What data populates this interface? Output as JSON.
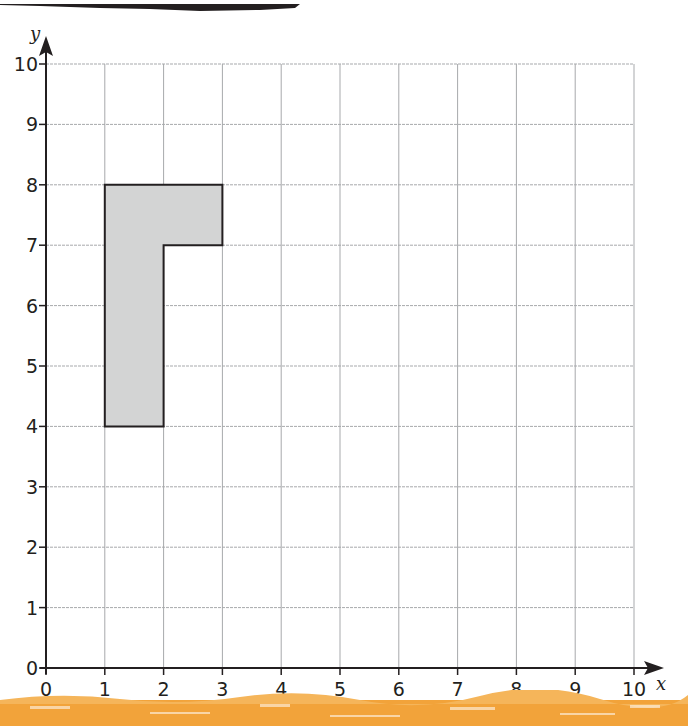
{
  "diagram": {
    "type": "coordinate-grid",
    "x_axis": {
      "label": "x",
      "min": 0,
      "max": 10,
      "ticks": [
        "0",
        "1",
        "2",
        "3",
        "4",
        "5",
        "6",
        "7",
        "8",
        "9",
        "10"
      ]
    },
    "y_axis": {
      "label": "y",
      "min": 0,
      "max": 10,
      "ticks": [
        "0",
        "1",
        "2",
        "3",
        "4",
        "5",
        "6",
        "7",
        "8",
        "9",
        "10"
      ]
    },
    "shape": {
      "name": "L-shape",
      "fill": "#d3d4d4",
      "stroke": "#231f20",
      "vertices": [
        [
          1,
          8
        ],
        [
          3,
          8
        ],
        [
          3,
          7
        ],
        [
          2,
          7
        ],
        [
          2,
          4
        ],
        [
          1,
          4
        ]
      ]
    },
    "colors": {
      "grid": "#a7a9ac",
      "axis": "#231f20",
      "top_band": "#231f20",
      "bottom_band": "#f0a030"
    }
  }
}
